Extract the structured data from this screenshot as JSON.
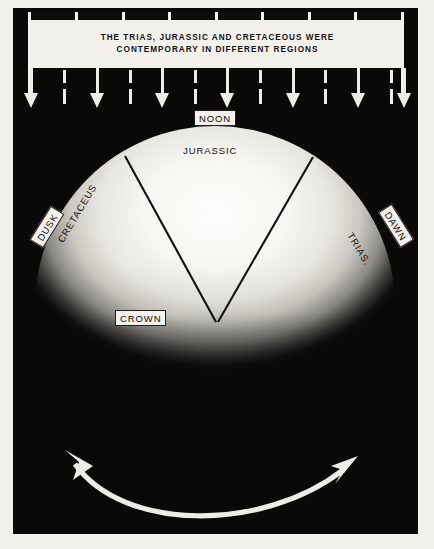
{
  "figure": {
    "caption_banner": {
      "line1": "THE TRIAS, JURASSIC AND CRETACEOUS WERE",
      "line2": "CONTEMPORARY IN DIFFERENT REGIONS"
    },
    "dome_labels": {
      "jurassic": "JURASSIC",
      "cretaceus": "CRETACEUS",
      "trias": "TRIAS."
    },
    "boxed_labels": {
      "noon": "NOON",
      "crown": "CROWN",
      "dusk": "DUSK",
      "dawn": "DAWN"
    },
    "colors": {
      "panel_black": "#0a0908",
      "paper_white": "#f3f1ec",
      "ink_black": "#141312",
      "dome_highlight": "#fdfdfb"
    },
    "ruler": {
      "tick_gap_positions": [
        57,
        104,
        150,
        197,
        243,
        290,
        336
      ],
      "arrow_positions": [
        30,
        96,
        161,
        226,
        292,
        357,
        403
      ],
      "dash_positions": [
        63,
        129,
        194,
        259,
        324,
        390
      ]
    }
  }
}
